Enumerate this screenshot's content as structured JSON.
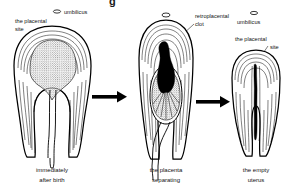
{
  "figure": {
    "domain": "medical-illustration",
    "title_fragment": "g",
    "background_color": "#ffffff",
    "ink_color": "#000000"
  },
  "panels": [
    {
      "id": "panel-immediately-after-birth",
      "caption_line1": "immediately",
      "caption_line2": "after birth",
      "labels": [
        {
          "name": "umbilicus",
          "text": "umbilicus",
          "has_icon": true
        },
        {
          "name": "placental-site",
          "line1": "the placental",
          "line2": "site",
          "has_icon": false
        }
      ]
    },
    {
      "id": "panel-placenta-separating",
      "caption_line1": "the placenta",
      "caption_line2": "separating",
      "labels": [
        {
          "name": "retroplacental-clot",
          "line1": "retroplacental",
          "line2": "clot",
          "has_icon": false
        }
      ]
    },
    {
      "id": "panel-empty-uterus",
      "caption_line1": "the empty",
      "caption_line2": "uterus",
      "labels": [
        {
          "name": "umbilicus",
          "text": "umbilicus",
          "has_icon": true
        },
        {
          "name": "placental-site",
          "line1": "the placental",
          "line2": "site",
          "has_icon": false
        }
      ]
    }
  ],
  "arrows": [
    {
      "name": "arrow-1",
      "from": "panel-immediately-after-birth",
      "to": "panel-placenta-separating"
    },
    {
      "name": "arrow-2",
      "from": "panel-placenta-separating",
      "to": "panel-empty-uterus"
    }
  ]
}
